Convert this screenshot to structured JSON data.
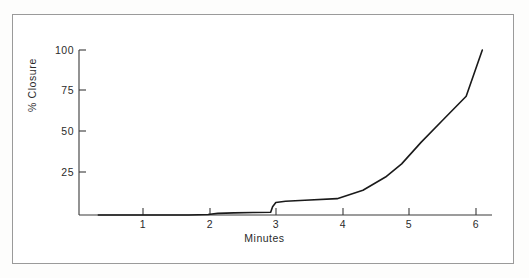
{
  "figure": {
    "frame_color": "#9a9a9a",
    "background": "#ffffff",
    "line_color": "#1a1a1a"
  },
  "chart_data": {
    "type": "line",
    "title": "",
    "subtitle": "",
    "xlabel": "Minutes",
    "ylabel": "% Closure",
    "xlim": [
      0.0,
      6.4
    ],
    "ylim": [
      0,
      103
    ],
    "xticks": [
      1,
      2,
      3,
      4,
      5,
      6
    ],
    "xtick_labels": [
      "1",
      "2",
      "3",
      "4",
      "5",
      "6"
    ],
    "yticks": [
      25,
      50,
      75,
      100
    ],
    "ytick_labels": [
      "25",
      "50",
      "75",
      "100"
    ],
    "grid": false,
    "legend": null,
    "series": [
      {
        "name": "% Closure",
        "x": [
          0.3,
          1.0,
          1.7,
          2.0,
          2.15,
          2.4,
          2.7,
          2.97,
          3.0,
          3.05,
          3.2,
          3.5,
          4.0,
          4.4,
          4.75,
          5.0,
          5.3,
          5.65,
          6.0,
          6.25
        ],
        "y": [
          0.0,
          0.0,
          0.0,
          0.3,
          1.0,
          1.3,
          1.5,
          1.7,
          5.0,
          7.6,
          8.3,
          8.9,
          9.9,
          15.0,
          23.0,
          31.0,
          44.0,
          58.0,
          72.0,
          100.0
        ]
      }
    ],
    "annotations": []
  }
}
